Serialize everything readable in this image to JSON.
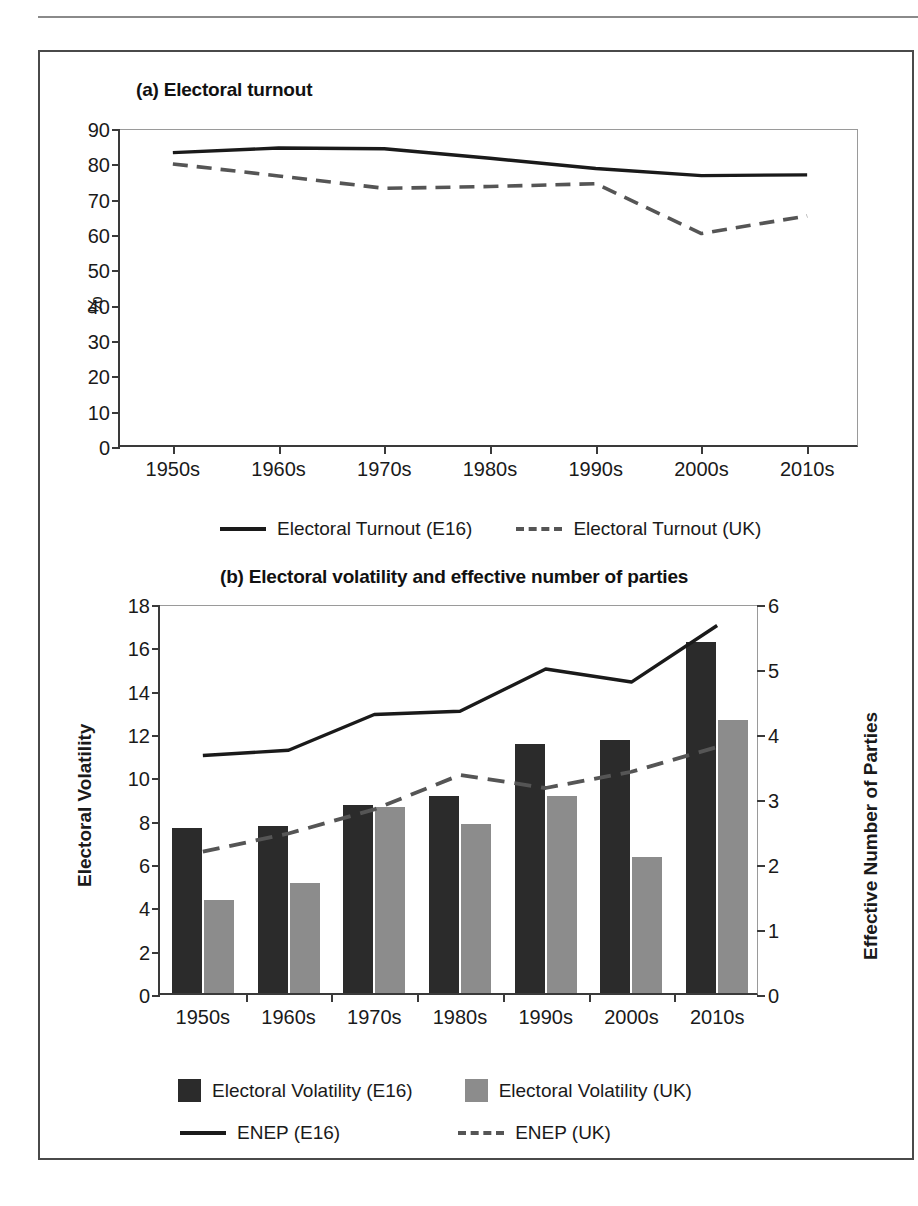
{
  "figure": {
    "panel_a_title": "(a) Electoral turnout",
    "panel_b_title": "(b) Electoral volatility and effective number of parties"
  },
  "colors": {
    "e16_bar": "#2b2b2b",
    "uk_bar": "#8c8c8c",
    "solid_line": "#1a1a1a",
    "dashed_line": "#555555",
    "axis": "#3a3a3a",
    "frame": "#9a9a9a"
  },
  "panel_a": {
    "title": "(a) Electoral turnout",
    "ylabel": "%",
    "yticks": [
      "0",
      "10",
      "20",
      "30",
      "40",
      "50",
      "60",
      "70",
      "80",
      "90"
    ],
    "xticks": [
      "1950s",
      "1960s",
      "1970s",
      "1980s",
      "1990s",
      "2000s",
      "2010s"
    ],
    "legend": [
      {
        "label": "Electoral Turnout (E16)",
        "style": "solid"
      },
      {
        "label": "Electoral Turnout (UK)",
        "style": "dashed"
      }
    ]
  },
  "panel_b": {
    "title": "(b) Electoral volatility and effective number of parties",
    "ylabel_left": "Electoral Volatility",
    "ylabel_right": "Effective Number of Parties",
    "yticks_left": [
      "0",
      "2",
      "4",
      "6",
      "8",
      "10",
      "12",
      "14",
      "16",
      "18"
    ],
    "yticks_right": [
      "0",
      "1",
      "2",
      "3",
      "4",
      "5",
      "6"
    ],
    "xticks": [
      "1950s",
      "1960s",
      "1970s",
      "1980s",
      "1990s",
      "2000s",
      "2010s"
    ],
    "legend": [
      {
        "label": "Electoral Volatility (E16)",
        "style": "bar-dark"
      },
      {
        "label": "Electoral Volatility (UK)",
        "style": "bar-light"
      },
      {
        "label": "ENEP (E16)",
        "style": "solid"
      },
      {
        "label": "ENEP (UK)",
        "style": "dashed"
      }
    ]
  },
  "chart_data": [
    {
      "type": "line",
      "title": "(a) Electoral turnout",
      "xlabel": "",
      "ylabel": "%",
      "ylim": [
        0,
        90
      ],
      "ytick_step": 10,
      "grid": false,
      "legend_position": "bottom",
      "categories": [
        "1950s",
        "1960s",
        "1970s",
        "1980s",
        "1990s",
        "2000s",
        "2010s"
      ],
      "series": [
        {
          "name": "Electoral Turnout (E16)",
          "style": "solid",
          "values": [
            83.6,
            84.9,
            84.7,
            82.0,
            79.1,
            77.1,
            77.3
          ]
        },
        {
          "name": "Electoral Turnout (UK)",
          "style": "dashed",
          "values": [
            80.4,
            77.0,
            73.5,
            74.0,
            74.8,
            60.7,
            65.7
          ]
        }
      ]
    },
    {
      "type": "bar+line",
      "title": "(b) Electoral volatility and effective number of parties",
      "xlabel": "",
      "ylabel": "Electoral Volatility",
      "ylabel_secondary": "Effective Number of Parties",
      "ylim": [
        0,
        18
      ],
      "ytick_step": 2,
      "ylim_secondary": [
        0,
        6
      ],
      "ytick_step_secondary": 1,
      "grid": false,
      "legend_position": "bottom",
      "categories": [
        "1950s",
        "1960s",
        "1970s",
        "1980s",
        "1990s",
        "2000s",
        "2010s"
      ],
      "series": [
        {
          "name": "Electoral Volatility (E16)",
          "style": "bar-dark",
          "axis": "left",
          "values": [
            7.6,
            7.7,
            8.7,
            9.1,
            11.5,
            11.7,
            16.2
          ]
        },
        {
          "name": "Electoral Volatility (UK)",
          "style": "bar-light",
          "axis": "left",
          "values": [
            4.3,
            5.1,
            8.6,
            7.8,
            9.1,
            6.3,
            12.6
          ]
        },
        {
          "name": "ENEP (E16)",
          "style": "solid",
          "axis": "right",
          "values": [
            3.7,
            3.78,
            4.33,
            4.38,
            5.03,
            4.83,
            5.7
          ]
        },
        {
          "name": "ENEP (UK)",
          "style": "dashed",
          "axis": "right",
          "values": [
            2.22,
            2.5,
            2.87,
            3.4,
            3.2,
            3.45,
            3.83
          ]
        }
      ]
    }
  ]
}
